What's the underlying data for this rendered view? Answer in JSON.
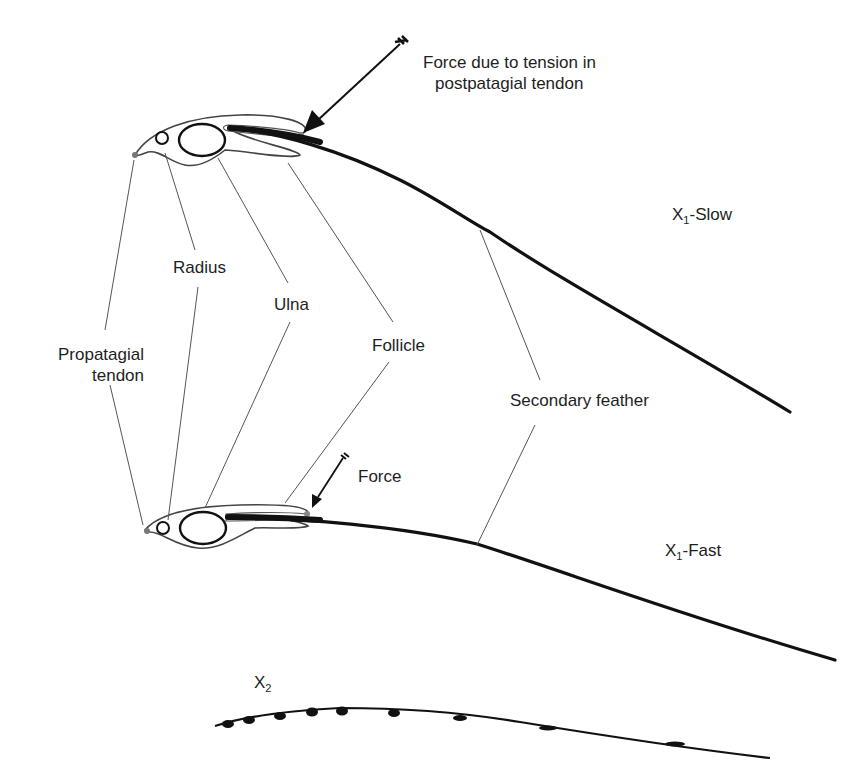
{
  "figure": {
    "type": "anatomical-diagram"
  },
  "labels": {
    "force_top_line1": "Force due to tension in",
    "force_top_line2": "postpatagial tendon",
    "propatagial_line1": "Propatagial",
    "propatagial_line2": "tendon",
    "radius": "Radius",
    "ulna": "Ulna",
    "follicle": "Follicle",
    "secondary_feather": "Secondary feather",
    "force_bottom": "Force",
    "x1_slow_base": "X",
    "x1_slow_sub": "1",
    "x1_slow_suffix": "-Slow",
    "x1_fast_base": "X",
    "x1_fast_sub": "1",
    "x1_fast_suffix": "-Fast",
    "x2_base": "X",
    "x2_sub": "2"
  },
  "colors": {
    "background": "#ffffff",
    "ink": "#1a1a1a",
    "leader_line": "#555555",
    "bone_outline": "#333333"
  }
}
